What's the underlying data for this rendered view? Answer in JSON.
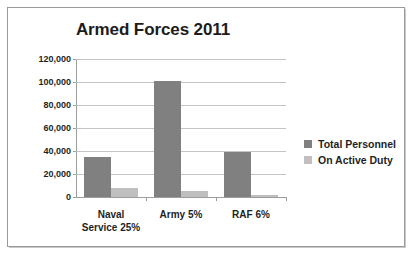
{
  "chart_data": {
    "type": "bar",
    "title": "Armed Forces 2011",
    "xlabel": "",
    "ylabel": "",
    "categories": [
      "Naval Service 25%",
      "Army 5%",
      "RAF 6%"
    ],
    "category_lines": [
      [
        "Naval",
        "Service 25%"
      ],
      [
        "Army 5%"
      ],
      [
        "RAF 6%"
      ]
    ],
    "series": [
      {
        "name": "Total Personnel",
        "color": "#808080",
        "values": [
          35000,
          101000,
          39500
        ]
      },
      {
        "name": "On Active Duty",
        "color": "#bfbfbf",
        "values": [
          8000,
          5000,
          1800
        ]
      }
    ],
    "ylim": [
      0,
      120000
    ],
    "ytick_values": [
      0,
      20000,
      40000,
      60000,
      80000,
      100000,
      120000
    ],
    "ytick_labels": [
      "0",
      "20,000",
      "40,000",
      "60,000",
      "80,000",
      "100,000",
      "120,000"
    ],
    "grid": true,
    "legend_position": "right"
  },
  "legend": {
    "items": [
      {
        "label": "Total Personnel",
        "color": "#808080"
      },
      {
        "label": "On Active Duty",
        "color": "#bfbfbf"
      }
    ]
  }
}
